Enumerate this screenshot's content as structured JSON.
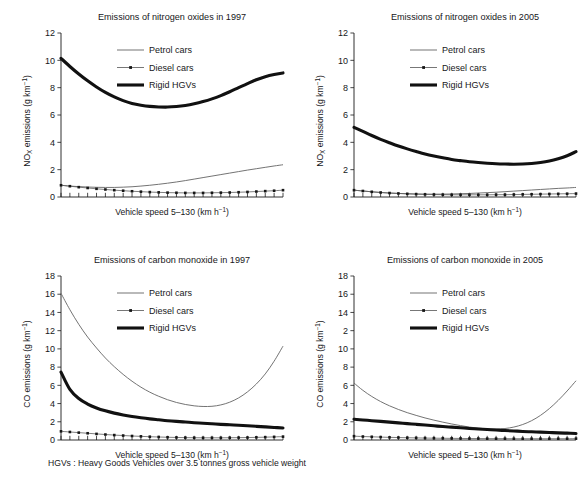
{
  "figure": {
    "width": 586,
    "height": 486,
    "footnote": "HGVs : Heavy Goods Vehicles over 3.5 tonnes gross vehicle weight",
    "colors": {
      "petrol": "#6b6b6b",
      "diesel": "#5e5e5e",
      "hgv": "#111111",
      "axis": "#1a1a1a",
      "text": "#17171a",
      "background": "#ffffff"
    }
  },
  "legend": {
    "position": "upper-center-inside",
    "entries": [
      {
        "label": "Petrol cars",
        "style": "thin-line",
        "key": "petrol"
      },
      {
        "label": "Diesel cars",
        "style": "line-with-dot-markers",
        "key": "diesel"
      },
      {
        "label": "Rigid HGVs",
        "style": "thick-line",
        "key": "hgv"
      }
    ]
  },
  "axis_labels": {
    "x": "Vehicle speed 5–130 (km h",
    "x_sup": "−1",
    "x_tail": ")",
    "y_nox_pre": "NO",
    "y_nox_sub": "X",
    "y_nox_post": " emissions (g km",
    "y_co_pre": "CO emissions (g km",
    "y_sup": "−1",
    "y_tail": ")"
  },
  "chart_data": [
    {
      "id": "nox-1997",
      "type": "line",
      "title": "Emissions of nitrogen oxides in 1997",
      "xlabel": "Vehicle speed 5–130 (km h⁻¹)",
      "ylabel": "NOₓ emissions (g km⁻¹)",
      "xlim": [
        5,
        130
      ],
      "ylim": [
        0,
        12
      ],
      "yticks": [
        0,
        2,
        4,
        6,
        8,
        10,
        12
      ],
      "ytick_labels": [
        "0",
        "2",
        "4",
        "6",
        "8",
        "10",
        "12"
      ],
      "grid": false,
      "x": [
        5,
        10,
        15,
        20,
        25,
        30,
        35,
        40,
        45,
        50,
        55,
        60,
        65,
        70,
        75,
        80,
        85,
        90,
        95,
        100,
        105,
        110,
        115,
        120,
        125,
        130
      ],
      "series": [
        {
          "name": "Petrol cars",
          "key": "petrol",
          "values": [
            0.86,
            0.8,
            0.76,
            0.73,
            0.71,
            0.7,
            0.7,
            0.72,
            0.75,
            0.8,
            0.86,
            0.93,
            1.01,
            1.1,
            1.2,
            1.31,
            1.42,
            1.53,
            1.64,
            1.75,
            1.86,
            1.97,
            2.07,
            2.17,
            2.27,
            2.36
          ]
        },
        {
          "name": "Diesel cars",
          "key": "diesel",
          "values": [
            0.86,
            0.79,
            0.72,
            0.66,
            0.6,
            0.55,
            0.5,
            0.46,
            0.42,
            0.39,
            0.36,
            0.34,
            0.32,
            0.31,
            0.3,
            0.3,
            0.3,
            0.31,
            0.32,
            0.33,
            0.35,
            0.37,
            0.4,
            0.43,
            0.46,
            0.5
          ]
        },
        {
          "name": "Rigid HGVs",
          "key": "hgv",
          "values": [
            10.15,
            9.55,
            9.0,
            8.5,
            8.05,
            7.65,
            7.32,
            7.05,
            6.85,
            6.72,
            6.63,
            6.59,
            6.58,
            6.62,
            6.7,
            6.82,
            6.98,
            7.18,
            7.42,
            7.7,
            8.0,
            8.3,
            8.58,
            8.8,
            8.96,
            9.08
          ]
        }
      ]
    },
    {
      "id": "nox-2005",
      "type": "line",
      "title": "Emissions of nitrogen oxides in 2005",
      "xlabel": "Vehicle speed 5–130 (km h⁻¹)",
      "ylabel": "NOₓ emissions (g km⁻¹)",
      "xlim": [
        5,
        130
      ],
      "ylim": [
        0,
        12
      ],
      "yticks": [
        0,
        2,
        4,
        6,
        8,
        10,
        12
      ],
      "ytick_labels": [
        "0",
        "2",
        "4",
        "6",
        "8",
        "10",
        "12"
      ],
      "grid": false,
      "x": [
        5,
        10,
        15,
        20,
        25,
        30,
        35,
        40,
        45,
        50,
        55,
        60,
        65,
        70,
        75,
        80,
        85,
        90,
        95,
        100,
        105,
        110,
        115,
        120,
        125,
        130
      ],
      "series": [
        {
          "name": "Petrol cars",
          "key": "petrol",
          "values": [
            0.5,
            0.44,
            0.38,
            0.33,
            0.29,
            0.26,
            0.24,
            0.22,
            0.21,
            0.21,
            0.21,
            0.22,
            0.24,
            0.26,
            0.29,
            0.32,
            0.35,
            0.39,
            0.43,
            0.47,
            0.51,
            0.55,
            0.59,
            0.63,
            0.66,
            0.7
          ]
        },
        {
          "name": "Diesel cars",
          "key": "diesel",
          "values": [
            0.5,
            0.44,
            0.38,
            0.33,
            0.29,
            0.26,
            0.23,
            0.21,
            0.19,
            0.18,
            0.17,
            0.16,
            0.16,
            0.16,
            0.16,
            0.16,
            0.17,
            0.17,
            0.18,
            0.19,
            0.2,
            0.21,
            0.22,
            0.23,
            0.24,
            0.25
          ]
        },
        {
          "name": "Rigid HGVs",
          "key": "hgv",
          "values": [
            5.1,
            4.8,
            4.5,
            4.22,
            3.97,
            3.73,
            3.52,
            3.33,
            3.15,
            3.0,
            2.87,
            2.75,
            2.66,
            2.58,
            2.52,
            2.47,
            2.43,
            2.41,
            2.4,
            2.41,
            2.45,
            2.52,
            2.63,
            2.8,
            3.02,
            3.32
          ]
        }
      ]
    },
    {
      "id": "co-1997",
      "type": "line",
      "title": "Emissions of carbon monoxide in 1997",
      "xlabel": "Vehicle speed 5–130 (km h⁻¹)",
      "ylabel": "CO emissions (g km⁻¹)",
      "xlim": [
        5,
        130
      ],
      "ylim": [
        0,
        18
      ],
      "yticks": [
        0,
        2,
        4,
        6,
        8,
        10,
        12,
        14,
        16,
        18
      ],
      "ytick_labels": [
        "0",
        "2",
        "4",
        "6",
        "8",
        "10",
        "12",
        "14",
        "16",
        "18"
      ],
      "grid": false,
      "x": [
        5,
        10,
        15,
        20,
        25,
        30,
        35,
        40,
        45,
        50,
        55,
        60,
        65,
        70,
        75,
        80,
        85,
        90,
        95,
        100,
        105,
        110,
        115,
        120,
        125,
        130
      ],
      "series": [
        {
          "name": "Petrol cars",
          "key": "petrol",
          "values": [
            16.1,
            14.3,
            12.7,
            11.3,
            10.1,
            9.0,
            8.05,
            7.2,
            6.45,
            5.8,
            5.25,
            4.8,
            4.42,
            4.12,
            3.9,
            3.75,
            3.68,
            3.7,
            3.85,
            4.15,
            4.62,
            5.28,
            6.15,
            7.25,
            8.65,
            10.3
          ]
        },
        {
          "name": "Diesel cars",
          "key": "diesel",
          "values": [
            0.95,
            0.88,
            0.81,
            0.74,
            0.67,
            0.6,
            0.54,
            0.49,
            0.44,
            0.4,
            0.36,
            0.33,
            0.3,
            0.28,
            0.26,
            0.25,
            0.24,
            0.24,
            0.24,
            0.25,
            0.26,
            0.27,
            0.29,
            0.31,
            0.34,
            0.37
          ]
        },
        {
          "name": "Rigid HGVs",
          "key": "hgv",
          "values": [
            7.45,
            5.55,
            4.55,
            3.95,
            3.52,
            3.2,
            2.95,
            2.75,
            2.58,
            2.44,
            2.32,
            2.22,
            2.12,
            2.04,
            1.97,
            1.9,
            1.84,
            1.78,
            1.72,
            1.67,
            1.62,
            1.56,
            1.5,
            1.44,
            1.38,
            1.32
          ]
        }
      ]
    },
    {
      "id": "co-2005",
      "type": "line",
      "title": "Emissions of carbon monoxide in 2005",
      "xlabel": "Vehicle speed 5–130 (km h⁻¹)",
      "ylabel": "CO emissions (g km⁻¹)",
      "xlim": [
        5,
        130
      ],
      "ylim": [
        0,
        18
      ],
      "yticks": [
        0,
        2,
        4,
        6,
        8,
        10,
        12,
        14,
        16,
        18
      ],
      "ytick_labels": [
        "0",
        "2",
        "4",
        "6",
        "8",
        "10",
        "2",
        "14",
        "16",
        "18"
      ],
      "grid": false,
      "x": [
        5,
        10,
        15,
        20,
        25,
        30,
        35,
        40,
        45,
        50,
        55,
        60,
        65,
        70,
        75,
        80,
        85,
        90,
        95,
        100,
        105,
        110,
        115,
        120,
        125,
        130
      ],
      "series": [
        {
          "name": "Petrol cars",
          "key": "petrol",
          "values": [
            6.25,
            5.45,
            4.78,
            4.22,
            3.75,
            3.35,
            3.0,
            2.7,
            2.42,
            2.18,
            1.96,
            1.76,
            1.58,
            1.42,
            1.3,
            1.22,
            1.2,
            1.26,
            1.42,
            1.7,
            2.12,
            2.7,
            3.45,
            4.35,
            5.38,
            6.5
          ]
        },
        {
          "name": "Diesel cars",
          "key": "diesel",
          "values": [
            0.42,
            0.38,
            0.35,
            0.32,
            0.29,
            0.27,
            0.25,
            0.23,
            0.21,
            0.2,
            0.19,
            0.18,
            0.17,
            0.16,
            0.16,
            0.15,
            0.15,
            0.15,
            0.14,
            0.14,
            0.14,
            0.14,
            0.14,
            0.14,
            0.14,
            0.15
          ]
        },
        {
          "name": "Rigid HGVs",
          "key": "hgv",
          "values": [
            2.28,
            2.2,
            2.12,
            2.04,
            1.96,
            1.88,
            1.8,
            1.72,
            1.64,
            1.56,
            1.48,
            1.41,
            1.34,
            1.27,
            1.21,
            1.15,
            1.09,
            1.04,
            0.99,
            0.94,
            0.9,
            0.86,
            0.82,
            0.78,
            0.75,
            0.72
          ]
        }
      ]
    }
  ],
  "panels": [
    {
      "id": "nox-1997",
      "x": 0,
      "y": 0,
      "w": 293,
      "h": 243
    },
    {
      "id": "nox-2005",
      "x": 293,
      "y": 0,
      "w": 293,
      "h": 243
    },
    {
      "id": "co-1997",
      "x": 0,
      "y": 243,
      "w": 293,
      "h": 243
    },
    {
      "id": "co-2005",
      "x": 293,
      "y": 243,
      "w": 293,
      "h": 243
    }
  ]
}
